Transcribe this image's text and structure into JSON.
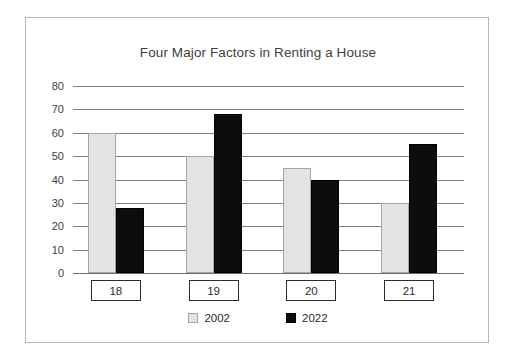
{
  "chart_data": {
    "type": "bar",
    "title": "Four Major Factors in Renting a House",
    "xlabel": "",
    "ylabel": "",
    "categories": [
      "18",
      "19",
      "20",
      "21"
    ],
    "series": [
      {
        "name": "2002",
        "color": "#e3e3e3",
        "values": [
          60,
          50,
          45,
          30
        ]
      },
      {
        "name": "2022",
        "color": "#0d0d0d",
        "values": [
          28,
          68,
          40,
          55
        ]
      }
    ],
    "ylim": [
      0,
      80
    ],
    "ytick_step": 10,
    "yticks": [
      "80",
      "70",
      "60",
      "50",
      "40",
      "30",
      "20",
      "10",
      "0"
    ],
    "grid": true,
    "legend_position": "bottom",
    "legend": [
      {
        "label": "2002",
        "swatch": "light-gray-square"
      },
      {
        "label": "2022",
        "swatch": "black-square"
      }
    ]
  },
  "figure": {
    "border_color": "#b8b8b8",
    "background": "#ffffff",
    "gridline_color": "#808080",
    "axis_text_color": "#3d3d3d",
    "title_color": "#404040"
  }
}
